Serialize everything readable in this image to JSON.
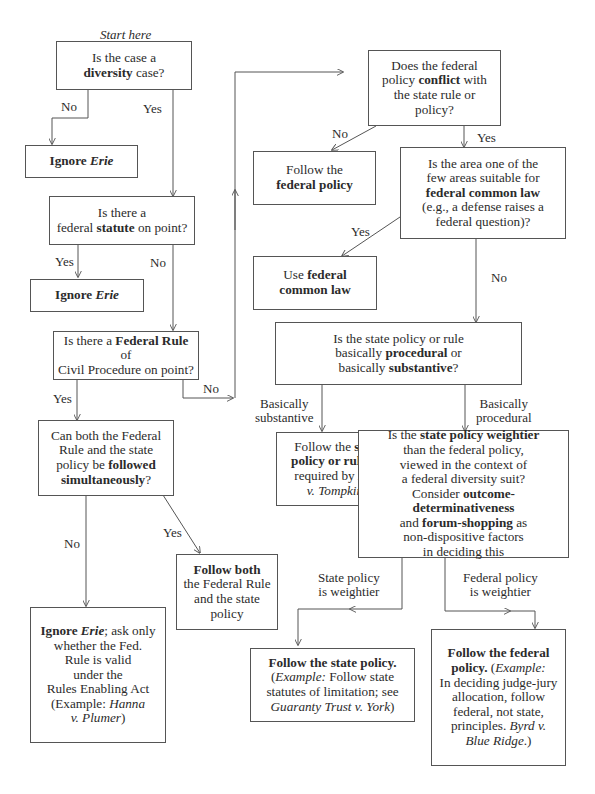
{
  "start_label": "Start here",
  "nodes": {
    "diversity": {
      "pre": "Is the case a",
      "bold": "diversity",
      "post": " case?"
    },
    "ignore_erie_1": {
      "bold": "Ignore ",
      "bold_italic": "Erie"
    },
    "statute": {
      "pre": "Is there a",
      "pre2": "federal ",
      "bold": "statute",
      "post": " on point?"
    },
    "ignore_erie_2": {
      "bold": "Ignore ",
      "bold_italic": "Erie"
    },
    "frcp": {
      "pre": "Is there a ",
      "bold": "Federal Rule",
      "post": " of",
      "line2": "Civil Procedure on point?"
    },
    "simultaneous": {
      "line1": "Can both the Federal",
      "line2": "Rule and the state",
      "line3_pre": "policy be ",
      "line3_bold": "followed",
      "line4_bold": "simultaneously",
      "line4_post": "?"
    },
    "ignore_erie_ask": {
      "bold": "Ignore ",
      "bold_italic": "Erie",
      "post": "; ask only",
      "line2": "whether the Fed.",
      "line3": "Rule is valid",
      "line4": "under the",
      "line5": "Rules Enabling Act",
      "line6_pre": "(Example: ",
      "line6_italic": "Hanna",
      "line7_italic": "v. Plumer",
      "line7_post": ")"
    },
    "follow_both": {
      "bold": "Follow both",
      "line2": "the Federal Rule",
      "line3": "and the state",
      "line4": "policy"
    },
    "conflict": {
      "line1": "Does the federal",
      "line2_pre": "policy ",
      "line2_bold": "conflict",
      "line2_post": " with",
      "line3": "the state rule or",
      "line4": "policy?"
    },
    "follow_federal_policy": {
      "line1": "Follow the",
      "line2_bold": "federal policy"
    },
    "common_law_q": {
      "line1": "Is the area one of the",
      "line2": "few areas suitable for",
      "line3_bold": "federal common law",
      "line4": "(e.g., a defense raises a",
      "line5": "federal question)?"
    },
    "use_common_law": {
      "pre": "Use ",
      "bold": "federal",
      "line2_bold": "common law"
    },
    "procedural_q": {
      "line1": "Is the state policy or rule",
      "line2_pre": "basically ",
      "line2_bold": "procedural",
      "line2_post": " or",
      "line3_pre": "basically ",
      "line3_bold": "substantive",
      "line3_post": "?"
    },
    "follow_state_rule": {
      "pre": "Follow the ",
      "bold": "state",
      "line2_bold": "policy or rule",
      "line2_post": ", as",
      "line3_pre": "required by ",
      "line3_italic": "Erie",
      "line4_italic": "v. Tompkins"
    },
    "weightier_q": {
      "line1_pre": "Is the ",
      "line1_bold": "state policy weightier",
      "line2": "than the federal policy,",
      "line3": "viewed in the context of",
      "line4": "a federal diversity suit?",
      "line5_pre": "Consider ",
      "line5_bold": "outcome-determinativeness",
      "line6_pre": "and ",
      "line6_bold": "forum-shopping",
      "line6_post": " as",
      "line7": "non-dispositive factors",
      "line8": "in deciding this"
    },
    "follow_state_policy": {
      "bold": "Follow the state policy.",
      "line2_pre": "(",
      "line2_italic": "Example:",
      "line2_post": " Follow state",
      "line3": "statutes of limitation; see",
      "line4_italic": "Guaranty Trust v. York",
      "line4_post": ")"
    },
    "follow_federal_final": {
      "bold": "Follow the federal",
      "line2_bold": "policy.",
      "line2_pre": " (",
      "line2_italic": "Example:",
      "line3": "In deciding judge-jury",
      "line4": "allocation, follow",
      "line5": "federal, not state,",
      "line6_pre": "principles. ",
      "line6_italic": "Byrd v.",
      "line7_italic": "Blue Ridge",
      "line7_post": ".)"
    }
  },
  "edge_labels": {
    "diversity_no": "No",
    "diversity_yes": "Yes",
    "statute_yes": "Yes",
    "statute_no": "No",
    "frcp_yes": "Yes",
    "frcp_no": "No",
    "simul_no": "No",
    "simul_yes": "Yes",
    "conflict_no": "No",
    "conflict_yes": "Yes",
    "common_yes": "Yes",
    "common_no": "No",
    "substantive_1": "Basically",
    "substantive_2": "substantive",
    "procedural_1": "Basically",
    "procedural_2": "procedural",
    "state_weightier_1": "State policy",
    "state_weightier_2": "is weightier",
    "federal_weightier_1": "Federal policy",
    "federal_weightier_2": "is weightier"
  },
  "colors": {
    "line": "#555555",
    "text": "#2b2b2b"
  }
}
